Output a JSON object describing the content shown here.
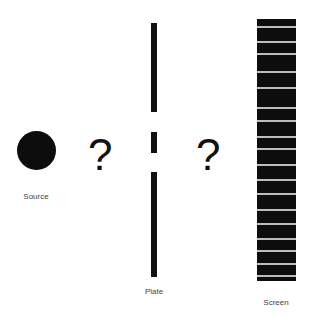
{
  "labels": {
    "source": "Source",
    "plate": "Plate",
    "screen": "Screen"
  },
  "question_marks": [
    "?",
    "?"
  ],
  "colors": {
    "ink": "#111111",
    "screen_line": "#bdbdbd"
  },
  "screen_line_positions": [
    26,
    41,
    53,
    71,
    87,
    107,
    120,
    136,
    148,
    164,
    179,
    193,
    209,
    223,
    238,
    250,
    263,
    275
  ]
}
